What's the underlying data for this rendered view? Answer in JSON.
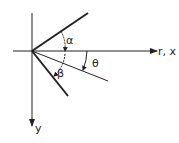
{
  "diagram": {
    "axes": {
      "horizontal_label": "r, x",
      "vertical_label": "y"
    },
    "angles": {
      "alpha": "α",
      "beta": "β",
      "theta": "θ"
    },
    "colors": {
      "stroke": "#222222",
      "background": "#ffffff"
    }
  }
}
